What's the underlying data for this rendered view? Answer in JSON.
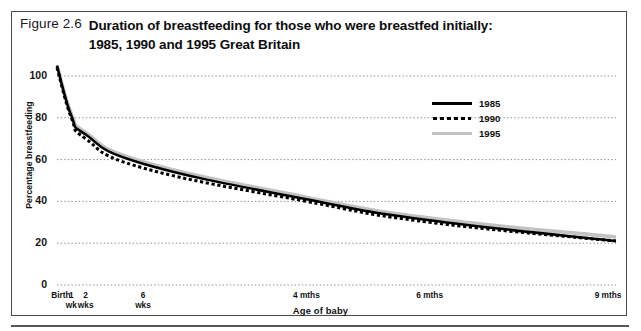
{
  "figure": {
    "number": "Figure 2.6",
    "title_line1": "Duration of breastfeeding for those who were breastfed initially:",
    "title_line2": "1985, 1990 and 1995 Great Britain"
  },
  "chart_data": {
    "type": "line",
    "xlabel": "Age of baby",
    "ylabel": "Percentage breastfeeding",
    "ylim": [
      0,
      110
    ],
    "yticks": [
      0,
      20,
      40,
      60,
      80,
      100
    ],
    "grid": "horizontal-dotted",
    "legend_position": "upper-right-inside",
    "x_positions_weeks": [
      0,
      1,
      2,
      6,
      17.4,
      26,
      39
    ],
    "categories": [
      "Birth\nwk",
      "1\nwk",
      "2\nwks",
      "6\nwks",
      "4 mths",
      "6 mths",
      "9 mths"
    ],
    "xtick_labels": [
      "Birth",
      "1\nwk",
      "2\nwks",
      "6\nwks",
      "4 mths",
      "6 mths",
      "9 mths"
    ],
    "series": [
      {
        "name": "1985",
        "style": "solid",
        "color": "#000000",
        "x": [
          0,
          1,
          2,
          6,
          17.4,
          26,
          39
        ],
        "values": [
          105,
          81,
          72,
          58,
          41,
          31,
          21
        ]
      },
      {
        "name": "1990",
        "style": "dotted",
        "color": "#000000",
        "x": [
          0,
          1,
          2,
          6,
          17.4,
          26,
          39
        ],
        "values": [
          104,
          80,
          70,
          56,
          40,
          30,
          21
        ]
      },
      {
        "name": "1995",
        "style": "solid",
        "color": "#c2c2c2",
        "x": [
          0,
          1,
          2,
          6,
          17.4,
          26,
          39
        ],
        "values": [
          105,
          82,
          73,
          59,
          42,
          32,
          23
        ]
      }
    ]
  },
  "legend": {
    "items": [
      {
        "label": "1985"
      },
      {
        "label": "1990"
      },
      {
        "label": "1995"
      }
    ]
  }
}
